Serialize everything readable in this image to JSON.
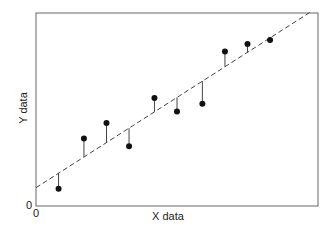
{
  "chart_data": {
    "type": "scatter",
    "title": "",
    "xlabel": "X data",
    "ylabel": "Y data",
    "x_tick_labels": [
      "0"
    ],
    "y_tick_labels": [
      "0"
    ],
    "grid": false,
    "legend": null,
    "xlim": [
      0,
      10
    ],
    "ylim": [
      0,
      10
    ],
    "points": [
      {
        "x": 0.8,
        "y": 0.9
      },
      {
        "x": 1.7,
        "y": 3.5
      },
      {
        "x": 2.5,
        "y": 4.3
      },
      {
        "x": 3.3,
        "y": 3.1
      },
      {
        "x": 4.2,
        "y": 5.6
      },
      {
        "x": 5.0,
        "y": 4.9
      },
      {
        "x": 5.9,
        "y": 5.3
      },
      {
        "x": 6.7,
        "y": 8.0
      },
      {
        "x": 7.5,
        "y": 8.4
      },
      {
        "x": 8.3,
        "y": 8.6
      }
    ],
    "fit_line": {
      "style": "dashed",
      "intercept": 0.95,
      "slope": 0.935,
      "x_range": [
        0,
        9.7
      ]
    },
    "residuals": "vertical lines from each point to fit line"
  },
  "labels": {
    "xlabel": "X data",
    "ylabel": "Y data",
    "x0": "0",
    "y0": "0"
  }
}
